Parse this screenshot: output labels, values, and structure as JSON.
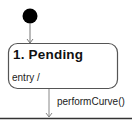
{
  "diagram": {
    "type": "UML state machine",
    "initial_state": {
      "shape": "filled-circle",
      "color": "#000000"
    },
    "states": [
      {
        "title": "1.  Pending",
        "entry_action": "entry /"
      }
    ],
    "transitions": [
      {
        "from": "initial",
        "to": "1.  Pending",
        "label": ""
      },
      {
        "from": "1.  Pending",
        "to": "next",
        "label": "performCurve()"
      }
    ],
    "colors": {
      "stroke": "#555555",
      "fill": "#ffffff",
      "initial_fill": "#000000",
      "bottom_border": "#333333"
    }
  }
}
